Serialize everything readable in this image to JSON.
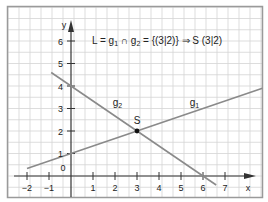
{
  "chart_data": {
    "type": "line",
    "title": "L = g1 ∩ g2 = {(3|2)} ⇒ S (3|2)",
    "title_parts": {
      "L": "L = g",
      "sub1": "1",
      "cap": " ∩ g",
      "sub2": "2",
      "rest": " = {(3|2)} ⇒ S (3|2)"
    },
    "xlabel": "x",
    "ylabel": "y",
    "xlim": [
      -2.4,
      8.8
    ],
    "ylim": [
      -0.9,
      7.6
    ],
    "grid": true,
    "x_ticks": [
      "-2",
      "-1",
      "1",
      "2",
      "3",
      "4",
      "5",
      "6",
      "7"
    ],
    "x_tick_values": [
      -2,
      -1,
      1,
      2,
      3,
      4,
      5,
      6,
      7
    ],
    "y_ticks": [
      "1",
      "2",
      "3",
      "4",
      "5",
      "6"
    ],
    "y_tick_values": [
      1,
      2,
      3,
      4,
      5,
      6
    ],
    "origin_label": "0",
    "series": [
      {
        "name": "g1",
        "label": "g",
        "sub": "1",
        "equation": "y = x/3 + 1",
        "x": [
          -2,
          8.7
        ],
        "y": [
          0.33,
          3.9
        ],
        "color": "#8a8a8a",
        "label_pos": [
          5.4,
          3.1
        ]
      },
      {
        "name": "g2",
        "label": "g",
        "sub": "2",
        "equation": "y = -2x/3 + 4",
        "x": [
          -0.9,
          6.6
        ],
        "y": [
          4.6,
          -0.4
        ],
        "color": "#8a8a8a",
        "label_pos": [
          1.9,
          3.1
        ]
      }
    ],
    "points": [
      {
        "name": "S",
        "x": 3,
        "y": 2,
        "label": "S"
      }
    ]
  },
  "colors": {
    "grid": "#d4d4d4",
    "frame": "#9a9a9a",
    "axis": "#333333",
    "line": "#8a8a8a",
    "point": "#111111"
  }
}
